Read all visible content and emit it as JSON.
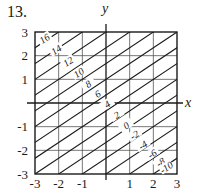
{
  "problem_number": "13.",
  "chart_data": {
    "type": "contour",
    "title": "",
    "xlabel": "x",
    "ylabel": "y",
    "xlim": [
      -3,
      3
    ],
    "ylim": [
      -3,
      3
    ],
    "grid": true,
    "x_ticks": [
      "-3",
      "-2",
      "-1",
      "1",
      "2",
      "3"
    ],
    "y_ticks": [
      "3",
      "2",
      "1",
      "-1",
      "-2",
      "-3"
    ],
    "contour_slope": 0.6667,
    "contour_intercepts": [
      5,
      4.3333,
      3.6667,
      3,
      2.3333,
      1.6667,
      1,
      0.3333,
      -0.3333,
      -1,
      -1.6667,
      -2.3333,
      -3,
      -3.6667,
      -4.3333,
      -5
    ],
    "levels": [
      {
        "value": "16",
        "x": -2.6,
        "y": 2.72
      },
      {
        "value": "14",
        "x": -2.1,
        "y": 2.25
      },
      {
        "value": "12",
        "x": -1.6,
        "y": 1.75
      },
      {
        "value": "10",
        "x": -1.15,
        "y": 1.28
      },
      {
        "value": "8",
        "x": -0.75,
        "y": 0.8
      },
      {
        "value": "6",
        "x": -0.35,
        "y": 0.38
      },
      {
        "value": "4",
        "x": 0.05,
        "y": -0.05
      },
      {
        "value": "2",
        "x": 0.45,
        "y": -0.5
      },
      {
        "value": "0",
        "x": 0.85,
        "y": -0.95
      },
      {
        "value": "-2",
        "x": 1.2,
        "y": -1.35
      },
      {
        "value": "-4",
        "x": 1.55,
        "y": -1.78
      },
      {
        "value": "-6",
        "x": 1.95,
        "y": -2.15
      },
      {
        "value": "-8",
        "x": 2.3,
        "y": -2.5
      },
      {
        "value": "-10",
        "x": 2.55,
        "y": -2.72
      }
    ]
  }
}
